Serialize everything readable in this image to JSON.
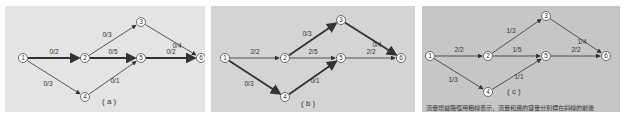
{
  "panels": [
    {
      "id": "a",
      "label": "( a )",
      "background": "#e4e4e4",
      "edges": [
        {
          "from": "1",
          "to": "2",
          "label": "0/2",
          "bold": true
        },
        {
          "from": "1",
          "to": "4",
          "label": "0/3",
          "bold": false
        },
        {
          "from": "2",
          "to": "3",
          "label": "0/3",
          "bold": false
        },
        {
          "from": "2",
          "to": "5",
          "label": "0/5",
          "bold": true
        },
        {
          "from": "4",
          "to": "5",
          "label": "0/1",
          "bold": false
        },
        {
          "from": "3",
          "to": "6",
          "label": "0/4",
          "bold": false
        },
        {
          "from": "5",
          "to": "6",
          "label": "0/2",
          "bold": true
        }
      ]
    },
    {
      "id": "b",
      "label": "( b )",
      "background": "#d4d4d4",
      "edges": [
        {
          "from": "1",
          "to": "2",
          "label": "2/2",
          "bold": false
        },
        {
          "from": "1",
          "to": "4",
          "label": "0/3",
          "bold": true
        },
        {
          "from": "2",
          "to": "3",
          "label": "0/3",
          "bold": true
        },
        {
          "from": "2",
          "to": "5",
          "label": "2/5",
          "bold": false
        },
        {
          "from": "4",
          "to": "5",
          "label": "0/1",
          "bold": true
        },
        {
          "from": "3",
          "to": "6",
          "label": "0/4",
          "bold": true
        },
        {
          "from": "5",
          "to": "6",
          "label": "2/2",
          "bold": false
        }
      ]
    },
    {
      "id": "c",
      "label": "( c )",
      "background": "#c6c6c6",
      "edges": [
        {
          "from": "1",
          "to": "2",
          "label": "2/2",
          "bold": false
        },
        {
          "from": "1",
          "to": "4",
          "label": "1/3",
          "bold": false
        },
        {
          "from": "2",
          "to": "3",
          "label": "1/3",
          "bold": false
        },
        {
          "from": "2",
          "to": "5",
          "label": "1/5",
          "bold": false
        },
        {
          "from": "4",
          "to": "5",
          "label": "1/1",
          "bold": false
        },
        {
          "from": "3",
          "to": "6",
          "label": "1/4",
          "bold": false
        },
        {
          "from": "5",
          "to": "6",
          "label": "2/2",
          "bold": false
        }
      ],
      "caption": "流量增益路徑用粗線表示，流量和邊的容量分別標在斜線的前後"
    }
  ],
  "nodes": [
    "1",
    "2",
    "3",
    "4",
    "5",
    "6"
  ]
}
